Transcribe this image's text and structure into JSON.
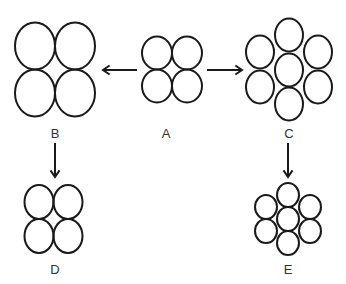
{
  "diagram": {
    "stroke_color": "#1a1a1a",
    "background": "#ffffff",
    "groups": [
      {
        "id": "A",
        "label": "A",
        "label_pos": [
          166,
          126
        ],
        "rx": 15,
        "ry": 16.5,
        "circles": [
          [
            157,
            53
          ],
          [
            187,
            53
          ],
          [
            157,
            86
          ],
          [
            187,
            86
          ]
        ]
      },
      {
        "id": "B",
        "label": "B",
        "label_pos": [
          55,
          126
        ],
        "rx": 20,
        "ry": 23.5,
        "circles": [
          [
            35,
            46
          ],
          [
            75,
            46
          ],
          [
            35,
            93
          ],
          [
            75,
            93
          ]
        ]
      },
      {
        "id": "C",
        "label": "C",
        "label_pos": [
          289,
          126
        ],
        "rx": 14,
        "ry": 16.5,
        "circles": [
          [
            289,
            35
          ],
          [
            260,
            52
          ],
          [
            318,
            52
          ],
          [
            289,
            70
          ],
          [
            260,
            87
          ],
          [
            318,
            87
          ],
          [
            289,
            104
          ]
        ]
      },
      {
        "id": "D",
        "label": "D",
        "label_pos": [
          55,
          262
        ],
        "rx": 14.5,
        "ry": 17,
        "circles": [
          [
            39,
            202
          ],
          [
            68,
            202
          ],
          [
            39,
            236
          ],
          [
            68,
            236
          ]
        ]
      },
      {
        "id": "E",
        "label": "E",
        "label_pos": [
          288,
          262
        ],
        "rx": 11,
        "ry": 12,
        "circles": [
          [
            288,
            195
          ],
          [
            266,
            207
          ],
          [
            310,
            207
          ],
          [
            288,
            219
          ],
          [
            266,
            231
          ],
          [
            310,
            231
          ],
          [
            288,
            243
          ]
        ]
      }
    ],
    "arrows": [
      {
        "from": "A",
        "to": "B",
        "x1": 137,
        "y1": 70,
        "x2": 103,
        "y2": 70
      },
      {
        "from": "A",
        "to": "C",
        "x1": 207,
        "y1": 70,
        "x2": 242,
        "y2": 70
      },
      {
        "from": "B",
        "to": "D",
        "x1": 55,
        "y1": 143,
        "x2": 55,
        "y2": 177
      },
      {
        "from": "C",
        "to": "E",
        "x1": 288,
        "y1": 143,
        "x2": 288,
        "y2": 177
      }
    ]
  }
}
